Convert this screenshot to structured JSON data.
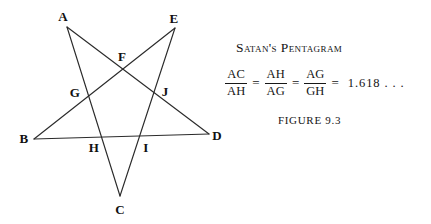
{
  "figure": {
    "title": "Satan's Pentagram",
    "caption": "FIGURE 9.3",
    "background_color": "#ffffff",
    "stroke_color": "#2b2b2b",
    "text_color": "#141414"
  },
  "equation": {
    "fractions": [
      {
        "numerator": "AC",
        "denominator": "AH"
      },
      {
        "numerator": "AH",
        "denominator": "AG"
      },
      {
        "numerator": "AG",
        "denominator": "GH"
      }
    ],
    "equals_signs": [
      "=",
      "=",
      "="
    ],
    "value": "1.618 . . ."
  },
  "diagram": {
    "type": "pentagram",
    "viewbox": "0 0 240 224",
    "outer_vertices": [
      {
        "id": "A",
        "x": 67,
        "y": 27,
        "label_x": 63,
        "label_y": 16
      },
      {
        "id": "E",
        "x": 175,
        "y": 28,
        "label_x": 174,
        "label_y": 18
      },
      {
        "id": "B",
        "x": 34,
        "y": 139,
        "label_x": 24,
        "label_y": 138
      },
      {
        "id": "D",
        "x": 209,
        "y": 134,
        "label_x": 217,
        "label_y": 135
      },
      {
        "id": "C",
        "x": 120,
        "y": 196,
        "label_x": 120,
        "label_y": 209
      }
    ],
    "inner_vertices": [
      {
        "id": "F",
        "x": 124,
        "y": 66,
        "label_x": 122,
        "label_y": 56
      },
      {
        "id": "G",
        "x": 86,
        "y": 94,
        "label_x": 75,
        "label_y": 92
      },
      {
        "id": "J",
        "x": 156,
        "y": 93,
        "label_x": 165,
        "label_y": 91
      },
      {
        "id": "H",
        "x": 97,
        "y": 136,
        "label_x": 94,
        "label_y": 147
      },
      {
        "id": "I",
        "x": 143,
        "y": 136,
        "label_x": 146,
        "label_y": 147
      }
    ],
    "edges": [
      {
        "from": "A",
        "to": "C"
      },
      {
        "from": "A",
        "to": "D"
      },
      {
        "from": "B",
        "to": "D"
      },
      {
        "from": "B",
        "to": "E"
      },
      {
        "from": "C",
        "to": "E"
      }
    ]
  }
}
